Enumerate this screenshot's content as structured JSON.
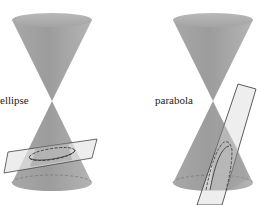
{
  "figure": {
    "panels": [
      {
        "id": "ellipse",
        "label": "ellipse",
        "description": "Double cone cut by a tilted plane producing an ellipse"
      },
      {
        "id": "parabola",
        "label": "parabola",
        "description": "Double cone cut by a plane parallel to a generator line producing a parabola"
      }
    ],
    "colors": {
      "cone_fill": "#9a9a9a",
      "cone_light": "#bdbdbd",
      "plane_fill": "#e4e4e4",
      "plane_stroke": "#333333",
      "curve_stroke": "#333333",
      "background": "#ffffff"
    }
  }
}
